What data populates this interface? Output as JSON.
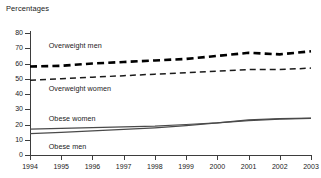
{
  "chart_data": {
    "type": "line",
    "title": "Percentages",
    "xlabel": "",
    "ylabel": "",
    "ylim": [
      0,
      80
    ],
    "ytick_step": 10,
    "yticks": [
      80,
      70,
      60,
      50,
      40,
      30,
      20,
      10,
      0
    ],
    "grid": false,
    "legend": "inline-labels",
    "x": [
      1994,
      1995,
      1996,
      1997,
      1998,
      1999,
      2000,
      2001,
      2002,
      2003
    ],
    "categories": [
      "1994",
      "1995",
      "1996",
      "1997",
      "1998",
      "1999",
      "2000",
      "2001",
      "2002",
      "2003"
    ],
    "series": [
      {
        "name": "Overweight men",
        "style": "dashed-thick",
        "color": "#000000",
        "label_x": 1994.6,
        "label_y": 72,
        "values": [
          58,
          58.5,
          60,
          61,
          62,
          63,
          65,
          67,
          66,
          68
        ]
      },
      {
        "name": "Overweight women",
        "style": "dashed-thin",
        "color": "#1a1a1a",
        "label_x": 1994.6,
        "label_y": 44,
        "values": [
          49,
          50,
          51,
          52,
          53,
          54,
          55,
          56,
          56,
          57
        ]
      },
      {
        "name": "Obese women",
        "style": "solid",
        "color": "#4a4a4a",
        "label_x": 1994.6,
        "label_y": 24,
        "values": [
          17,
          17.5,
          18,
          18.5,
          19,
          20,
          21,
          22.5,
          23.5,
          24
        ]
      },
      {
        "name": "Obese men",
        "style": "solid",
        "color": "#4a4a4a",
        "label_x": 1994.6,
        "label_y": 6,
        "values": [
          14,
          14.8,
          15.8,
          16.8,
          17.8,
          19.2,
          21,
          23,
          23.8,
          24.2
        ]
      }
    ]
  }
}
